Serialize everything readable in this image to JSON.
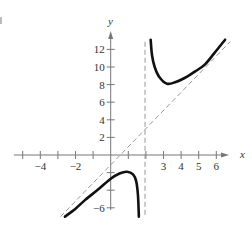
{
  "chart_data": {
    "type": "line",
    "title": "",
    "xlabel": "x",
    "ylabel": "y",
    "xlim": [
      -5.2,
      6.8
    ],
    "ylim": [
      -6.5,
      14
    ],
    "grid": false,
    "x_ticks": [
      -5,
      -4,
      -3,
      -2,
      -1,
      1,
      2,
      3,
      4,
      5,
      6
    ],
    "x_tick_labels": [
      {
        "value": -4,
        "label": "−4"
      },
      {
        "value": -2,
        "label": "−2"
      },
      {
        "value": 3,
        "label": "3"
      },
      {
        "value": 4,
        "label": "4"
      },
      {
        "value": 5,
        "label": "5"
      },
      {
        "value": 6,
        "label": "6"
      }
    ],
    "y_ticks": [
      -6,
      -4,
      -2,
      2,
      4,
      6,
      8,
      10,
      12
    ],
    "y_tick_labels": [
      {
        "value": -6,
        "label": "−6"
      },
      {
        "value": 2,
        "label": "2"
      },
      {
        "value": 4,
        "label": "4"
      },
      {
        "value": 6,
        "label": "6"
      },
      {
        "value": 8,
        "label": "8"
      },
      {
        "value": 10,
        "label": "10"
      },
      {
        "value": 12,
        "label": "12"
      }
    ],
    "series": [
      {
        "name": "lower branch",
        "style": "solid",
        "x": [
          -2.6,
          -2.0,
          -1.45,
          -0.7,
          0.0,
          0.5,
          0.93,
          1.27,
          1.45,
          1.55,
          1.6
        ],
        "y": [
          -7.0,
          -6.1,
          -5.1,
          -3.9,
          -2.7,
          -2.1,
          -1.9,
          -2.2,
          -3.0,
          -4.6,
          -7.0
        ]
      },
      {
        "name": "upper branch",
        "style": "solid",
        "x": [
          2.27,
          2.35,
          2.5,
          2.75,
          3.2,
          3.7,
          4.2,
          4.8,
          5.36,
          5.9,
          6.5
        ],
        "y": [
          13.1,
          11.3,
          10.0,
          8.9,
          8.1,
          8.3,
          8.75,
          9.5,
          10.3,
          11.6,
          13.1
        ]
      },
      {
        "name": "oblique asymptote",
        "style": "dashed",
        "x": [
          -2.85,
          6.8
        ],
        "y": [
          -7.0,
          12.9
        ]
      },
      {
        "name": "vertical asymptote",
        "style": "dashed",
        "x": [
          1.95,
          1.95
        ],
        "y": [
          -6.8,
          13.1
        ]
      }
    ]
  },
  "labels": {
    "x_axis": "x",
    "y_axis": "y"
  },
  "colors": {
    "curve": "#111111",
    "axis": "#777777",
    "asymptote": "#999999",
    "text": "#333333"
  }
}
